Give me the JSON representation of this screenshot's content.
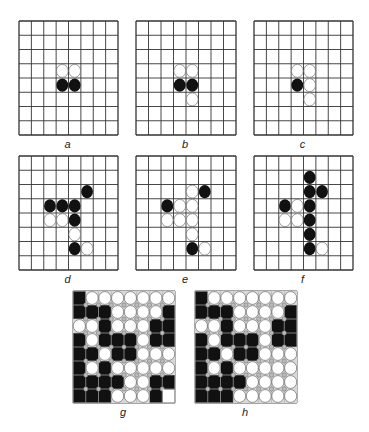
{
  "figure": {
    "boards": [
      {
        "id": "a",
        "label": "a",
        "x": 18,
        "y": 20,
        "w": 99,
        "h": 114,
        "cols": 8,
        "rows": 8,
        "filled": false,
        "stones": [
          {
            "r": 3,
            "c": 3,
            "color": "W"
          },
          {
            "r": 3,
            "c": 4,
            "color": "W"
          },
          {
            "r": 4,
            "c": 3,
            "color": "B"
          },
          {
            "r": 4,
            "c": 4,
            "color": "B"
          }
        ]
      },
      {
        "id": "b",
        "label": "b",
        "x": 135,
        "y": 20,
        "w": 100,
        "h": 114,
        "cols": 8,
        "rows": 8,
        "filled": false,
        "stones": [
          {
            "r": 3,
            "c": 3,
            "color": "W"
          },
          {
            "r": 3,
            "c": 4,
            "color": "W"
          },
          {
            "r": 4,
            "c": 3,
            "color": "B"
          },
          {
            "r": 4,
            "c": 4,
            "color": "B"
          },
          {
            "r": 5,
            "c": 4,
            "color": "W"
          }
        ]
      },
      {
        "id": "c",
        "label": "c",
        "x": 253,
        "y": 20,
        "w": 99,
        "h": 114,
        "cols": 8,
        "rows": 8,
        "filled": false,
        "stones": [
          {
            "r": 3,
            "c": 3,
            "color": "W"
          },
          {
            "r": 3,
            "c": 4,
            "color": "W"
          },
          {
            "r": 4,
            "c": 3,
            "color": "B"
          },
          {
            "r": 4,
            "c": 4,
            "color": "W"
          },
          {
            "r": 5,
            "c": 4,
            "color": "W"
          }
        ]
      },
      {
        "id": "d",
        "label": "d",
        "x": 18,
        "y": 155,
        "w": 99,
        "h": 114,
        "cols": 8,
        "rows": 8,
        "filled": false,
        "stones": [
          {
            "r": 2,
            "c": 5,
            "color": "B"
          },
          {
            "r": 3,
            "c": 2,
            "color": "B"
          },
          {
            "r": 3,
            "c": 3,
            "color": "B"
          },
          {
            "r": 3,
            "c": 4,
            "color": "B"
          },
          {
            "r": 4,
            "c": 2,
            "color": "W"
          },
          {
            "r": 4,
            "c": 3,
            "color": "W"
          },
          {
            "r": 4,
            "c": 4,
            "color": "B"
          },
          {
            "r": 5,
            "c": 4,
            "color": "W"
          },
          {
            "r": 6,
            "c": 4,
            "color": "B"
          },
          {
            "r": 6,
            "c": 5,
            "color": "W"
          }
        ]
      },
      {
        "id": "e",
        "label": "e",
        "x": 135,
        "y": 155,
        "w": 100,
        "h": 114,
        "cols": 8,
        "rows": 8,
        "filled": false,
        "stones": [
          {
            "r": 2,
            "c": 4,
            "color": "W"
          },
          {
            "r": 2,
            "c": 5,
            "color": "B"
          },
          {
            "r": 3,
            "c": 2,
            "color": "B"
          },
          {
            "r": 3,
            "c": 3,
            "color": "W"
          },
          {
            "r": 3,
            "c": 4,
            "color": "W"
          },
          {
            "r": 4,
            "c": 2,
            "color": "W"
          },
          {
            "r": 4,
            "c": 3,
            "color": "W"
          },
          {
            "r": 4,
            "c": 4,
            "color": "W"
          },
          {
            "r": 5,
            "c": 4,
            "color": "W"
          },
          {
            "r": 6,
            "c": 4,
            "color": "B"
          },
          {
            "r": 6,
            "c": 5,
            "color": "W"
          }
        ]
      },
      {
        "id": "f",
        "label": "f",
        "x": 253,
        "y": 155,
        "w": 99,
        "h": 114,
        "cols": 8,
        "rows": 8,
        "filled": false,
        "stones": [
          {
            "r": 1,
            "c": 4,
            "color": "B"
          },
          {
            "r": 2,
            "c": 4,
            "color": "B"
          },
          {
            "r": 2,
            "c": 5,
            "color": "B"
          },
          {
            "r": 3,
            "c": 2,
            "color": "B"
          },
          {
            "r": 3,
            "c": 3,
            "color": "W"
          },
          {
            "r": 3,
            "c": 4,
            "color": "B"
          },
          {
            "r": 4,
            "c": 2,
            "color": "W"
          },
          {
            "r": 4,
            "c": 3,
            "color": "W"
          },
          {
            "r": 4,
            "c": 4,
            "color": "B"
          },
          {
            "r": 5,
            "c": 4,
            "color": "B"
          },
          {
            "r": 6,
            "c": 4,
            "color": "B"
          },
          {
            "r": 6,
            "c": 5,
            "color": "W"
          }
        ]
      },
      {
        "id": "g",
        "label": "g",
        "x": 72,
        "y": 290,
        "w": 102,
        "h": 112,
        "cols": 8,
        "rows": 8,
        "filled": true,
        "grid": [
          "BWWWWWWW",
          "BBBWWWWB",
          "WWBWWWBB",
          "BWBBBWBB",
          "BBWBBWWW",
          "BWBWWWWW",
          "BBBBWWBB",
          "BBBWWWBE"
        ]
      },
      {
        "id": "h",
        "label": "h",
        "x": 194,
        "y": 290,
        "w": 102,
        "h": 112,
        "cols": 8,
        "rows": 8,
        "filled": true,
        "grid": [
          "BWWWWWWW",
          "BBBWWWWB",
          "WWBWWWBB",
          "BWBBBWBB",
          "BBWBBWWW",
          "BWBWWWWW",
          "BBBBWWWW",
          "BBBWWWWW"
        ]
      }
    ],
    "colors": {
      "black_stone": "#111111",
      "white_stone": "#ffffff",
      "grid_line": "#333333",
      "background": "#ffffff"
    }
  }
}
